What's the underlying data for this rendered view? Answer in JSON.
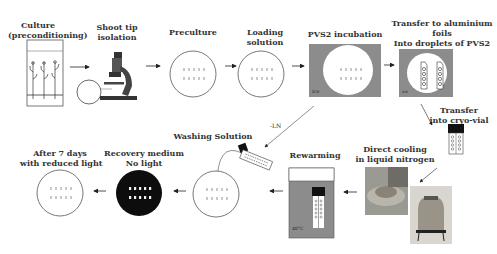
{
  "steps": {
    "culture": {
      "line1": "Culture",
      "line2": "(preconditioning)"
    },
    "shoot_tip": {
      "line1": "Shoot tip",
      "line2": "isolation"
    },
    "preculture": {
      "label": "Preculture"
    },
    "loading": {
      "line1": "Loading",
      "line2": "solution"
    },
    "pvs2_incubation": {
      "label": "PVS2 incubation",
      "ice": "ice"
    },
    "transfer_foils": {
      "line1": "Transfer to aluminium",
      "line2": "foils",
      "line3": "Into droplets of PVS2",
      "ice": "ice"
    },
    "transfer_vial": {
      "line1": "Transfer",
      "line2": "into cryo-vial"
    },
    "direct_cooling": {
      "line1": "Direct cooling",
      "line2": "in liquid nitrogen"
    },
    "rewarming": {
      "label": "Rewarming",
      "temp": "40°C"
    },
    "washing": {
      "label": "Washing Solution"
    },
    "recovery": {
      "line1": "Recovery medium",
      "line2": "No light"
    },
    "after7": {
      "line1": "After 7 days",
      "line2": "with reduced light"
    }
  },
  "arrows": {
    "minus_ln": "-LN"
  },
  "colors": {
    "ice_gray": "#8c8c8c",
    "dark": "#111111",
    "outline": "#555555",
    "dot": "#c9c9c9"
  }
}
